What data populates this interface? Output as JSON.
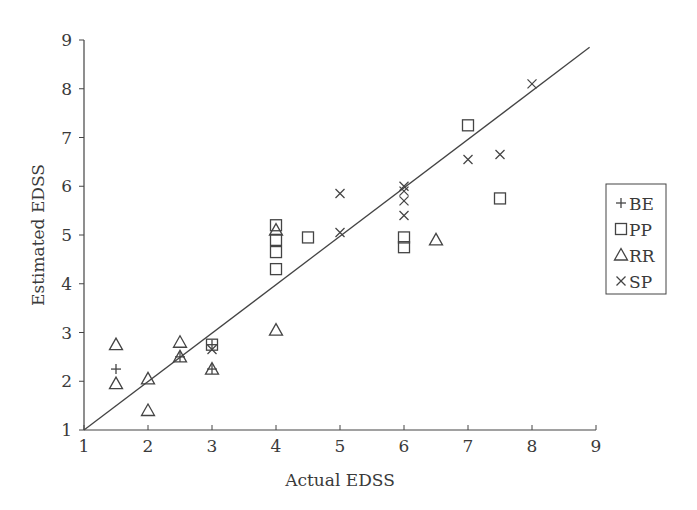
{
  "chart_data": {
    "type": "scatter",
    "title": "",
    "xlabel": "Actual EDSS",
    "ylabel": "Estimated EDSS",
    "xlim": [
      1,
      9
    ],
    "ylim": [
      1,
      9
    ],
    "xticks": [
      1,
      2,
      3,
      4,
      5,
      6,
      7,
      8,
      9
    ],
    "yticks": [
      1,
      2,
      3,
      4,
      5,
      6,
      7,
      8,
      9
    ],
    "grid": false,
    "legend_position": "right",
    "reference_line": {
      "from": [
        1,
        1
      ],
      "to": [
        8.9,
        8.85
      ],
      "label": "identity"
    },
    "series": [
      {
        "name": "BE",
        "marker": "+",
        "points": [
          [
            1.5,
            2.25
          ],
          [
            2.5,
            2.5
          ],
          [
            3.0,
            2.75
          ],
          [
            3.0,
            2.25
          ]
        ]
      },
      {
        "name": "PP",
        "marker": "square",
        "points": [
          [
            3.0,
            2.75
          ],
          [
            4.0,
            5.2
          ],
          [
            4.0,
            4.9
          ],
          [
            4.0,
            4.65
          ],
          [
            4.0,
            4.3
          ],
          [
            4.5,
            4.95
          ],
          [
            6.0,
            4.95
          ],
          [
            6.0,
            4.75
          ],
          [
            7.0,
            7.25
          ],
          [
            7.5,
            5.75
          ]
        ]
      },
      {
        "name": "RR",
        "marker": "triangle",
        "points": [
          [
            1.5,
            2.75
          ],
          [
            1.5,
            1.95
          ],
          [
            2.0,
            2.05
          ],
          [
            2.0,
            1.4
          ],
          [
            2.5,
            2.8
          ],
          [
            2.5,
            2.5
          ],
          [
            3.0,
            2.25
          ],
          [
            4.0,
            5.1
          ],
          [
            4.0,
            3.05
          ],
          [
            6.5,
            4.9
          ]
        ]
      },
      {
        "name": "SP",
        "marker": "x",
        "points": [
          [
            3.0,
            2.65
          ],
          [
            5.0,
            5.85
          ],
          [
            5.0,
            5.05
          ],
          [
            6.0,
            6.0
          ],
          [
            6.0,
            5.9
          ],
          [
            6.0,
            5.7
          ],
          [
            6.0,
            5.4
          ],
          [
            7.0,
            6.55
          ],
          [
            7.5,
            6.65
          ],
          [
            8.0,
            8.1
          ]
        ]
      }
    ]
  },
  "legend": {
    "items": [
      {
        "symbol": "+",
        "label": "BE"
      },
      {
        "symbol": "□",
        "label": "PP"
      },
      {
        "symbol": "△",
        "label": "RR"
      },
      {
        "symbol": "×",
        "label": "SP"
      }
    ]
  }
}
